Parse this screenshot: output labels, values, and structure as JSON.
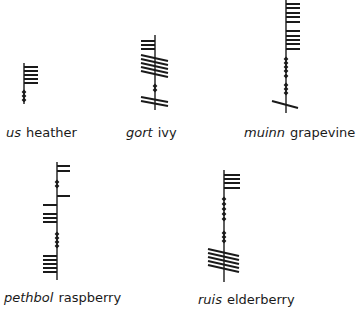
{
  "figure": {
    "items": [
      {
        "name": "us",
        "gloss": "heather",
        "stem_x": 24,
        "stem_top": 63,
        "stem_bottom": 104
      },
      {
        "name": "gort",
        "gloss": "ivy",
        "stem_x": 155,
        "stem_top": 35,
        "stem_bottom": 110
      },
      {
        "name": "muinn",
        "gloss": "grapevine",
        "stem_x": 286,
        "stem_top": 0,
        "stem_bottom": 113
      },
      {
        "name": "pethbol",
        "gloss": "raspberry",
        "stem_x": 57,
        "stem_top": 162,
        "stem_bottom": 280
      },
      {
        "name": "ruis",
        "gloss": "elderberry",
        "stem_x": 224,
        "stem_top": 170,
        "stem_bottom": 282
      }
    ]
  },
  "colors": {
    "ink": "#1a1a1a",
    "background": "#ffffff"
  }
}
